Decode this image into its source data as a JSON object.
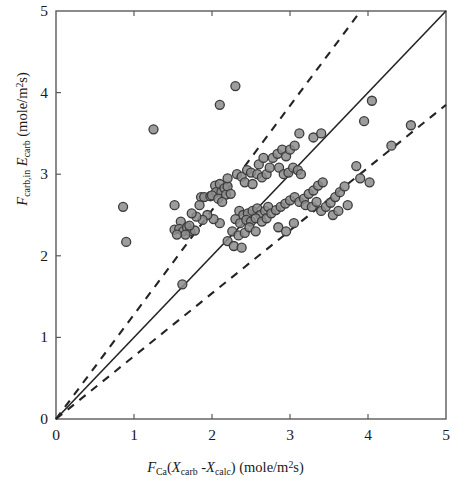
{
  "figure": {
    "background": "#ffffff",
    "frame_color": "#4a4a4a"
  },
  "axes": {
    "x_ticks": [
      "0",
      "1",
      "2",
      "3",
      "4",
      "5"
    ],
    "y_ticks": [
      "0",
      "1",
      "2",
      "3",
      "4",
      "5"
    ],
    "xlabel_parts": {
      "f": "F",
      "f_sub": "Ca",
      "open": "(",
      "x1": "X",
      "x1_sub": "carb",
      "minus": " -",
      "x2": "X",
      "x2_sub": "calc",
      "close": ")",
      "units_open": " (mole/m",
      "units_sup": "2",
      "units_close": "s)"
    },
    "ylabel_parts": {
      "f": "F",
      "f_sub": "carb,in",
      "e": "E",
      "e_sub": "carb",
      "units_open": " (mole/m",
      "units_sup": "2",
      "units_close": "s)"
    }
  },
  "chart_data": {
    "type": "scatter",
    "title": "",
    "xlabel": "F_Ca(X_carb - X_calc) (mole/m^2 s)",
    "ylabel": "F_carb,in E_carb (mole/m^2 s)",
    "xlim": [
      0,
      5
    ],
    "ylim": [
      0,
      5
    ],
    "xticks": [
      0,
      1,
      2,
      3,
      4,
      5
    ],
    "yticks": [
      0,
      1,
      2,
      3,
      4,
      5
    ],
    "grid": false,
    "legend": null,
    "marker": {
      "shape": "circle",
      "fill": "#8c8c8c",
      "edge": "#3c3c3c",
      "size_px": 9,
      "opacity": 0.85
    },
    "reference_lines": [
      {
        "name": "parity-line",
        "style": "solid",
        "color": "#242424",
        "slope": 1.0,
        "intercept": 0,
        "label": "1:1 line"
      },
      {
        "name": "upper-bound-line",
        "style": "dashed",
        "color": "#242424",
        "slope": 1.28,
        "intercept": 0,
        "label": "+28% bound"
      },
      {
        "name": "lower-bound-line",
        "style": "dashed",
        "color": "#242424",
        "slope": 0.77,
        "intercept": 0,
        "label": "-23% bound"
      }
    ],
    "points": [
      [
        0.86,
        2.6
      ],
      [
        0.9,
        2.17
      ],
      [
        1.25,
        3.55
      ],
      [
        1.52,
        2.62
      ],
      [
        1.6,
        2.42
      ],
      [
        1.62,
        1.65
      ],
      [
        1.52,
        2.32
      ],
      [
        1.58,
        2.33
      ],
      [
        1.63,
        2.3
      ],
      [
        1.68,
        2.35
      ],
      [
        1.72,
        2.3
      ],
      [
        1.66,
        2.26
      ],
      [
        1.78,
        2.31
      ],
      [
        1.55,
        2.26
      ],
      [
        1.71,
        2.37
      ],
      [
        1.86,
        2.72
      ],
      [
        1.9,
        2.72
      ],
      [
        1.98,
        2.73
      ],
      [
        1.84,
        2.62
      ],
      [
        2.04,
        2.86
      ],
      [
        2.1,
        2.88
      ],
      [
        2.05,
        2.78
      ],
      [
        2.12,
        2.78
      ],
      [
        2.16,
        2.83
      ],
      [
        2.0,
        2.74
      ],
      [
        2.08,
        2.7
      ],
      [
        2.18,
        2.75
      ],
      [
        2.2,
        2.85
      ],
      [
        2.24,
        2.76
      ],
      [
        2.13,
        2.66
      ],
      [
        2.1,
        3.85
      ],
      [
        2.3,
        4.08
      ],
      [
        2.2,
        2.95
      ],
      [
        2.32,
        3.0
      ],
      [
        2.38,
        2.97
      ],
      [
        2.45,
        3.05
      ],
      [
        2.5,
        3.02
      ],
      [
        2.42,
        2.9
      ],
      [
        2.52,
        2.88
      ],
      [
        2.6,
        3.12
      ],
      [
        2.66,
        3.2
      ],
      [
        2.58,
        3.0
      ],
      [
        2.64,
        2.96
      ],
      [
        2.7,
        3.0
      ],
      [
        2.74,
        3.08
      ],
      [
        2.78,
        3.2
      ],
      [
        2.84,
        3.25
      ],
      [
        2.9,
        3.3
      ],
      [
        2.95,
        3.22
      ],
      [
        3.0,
        3.3
      ],
      [
        3.06,
        3.35
      ],
      [
        2.86,
        3.08
      ],
      [
        2.92,
        3.0
      ],
      [
        2.98,
        3.02
      ],
      [
        3.04,
        3.08
      ],
      [
        3.1,
        3.05
      ],
      [
        3.14,
        3.0
      ],
      [
        2.35,
        2.55
      ],
      [
        2.4,
        2.5
      ],
      [
        2.46,
        2.52
      ],
      [
        2.52,
        2.55
      ],
      [
        2.58,
        2.58
      ],
      [
        2.62,
        2.5
      ],
      [
        2.68,
        2.55
      ],
      [
        2.72,
        2.6
      ],
      [
        2.3,
        2.45
      ],
      [
        2.36,
        2.4
      ],
      [
        2.44,
        2.44
      ],
      [
        2.5,
        2.42
      ],
      [
        2.56,
        2.46
      ],
      [
        2.64,
        2.42
      ],
      [
        2.7,
        2.46
      ],
      [
        2.76,
        2.52
      ],
      [
        2.82,
        2.56
      ],
      [
        2.88,
        2.6
      ],
      [
        2.94,
        2.64
      ],
      [
        3.0,
        2.68
      ],
      [
        3.06,
        2.72
      ],
      [
        3.12,
        2.66
      ],
      [
        3.18,
        2.7
      ],
      [
        3.24,
        2.76
      ],
      [
        3.3,
        2.8
      ],
      [
        3.36,
        2.86
      ],
      [
        3.42,
        2.9
      ],
      [
        3.2,
        2.62
      ],
      [
        3.28,
        2.6
      ],
      [
        3.34,
        2.66
      ],
      [
        3.4,
        2.55
      ],
      [
        3.46,
        2.6
      ],
      [
        3.52,
        2.65
      ],
      [
        3.58,
        2.72
      ],
      [
        3.64,
        2.78
      ],
      [
        3.7,
        2.85
      ],
      [
        3.55,
        2.5
      ],
      [
        3.62,
        2.55
      ],
      [
        3.74,
        2.62
      ],
      [
        2.26,
        2.3
      ],
      [
        2.34,
        2.25
      ],
      [
        2.42,
        2.28
      ],
      [
        2.2,
        2.18
      ],
      [
        2.28,
        2.12
      ],
      [
        2.38,
        2.1
      ],
      [
        2.48,
        2.35
      ],
      [
        2.56,
        2.3
      ],
      [
        2.1,
        2.4
      ],
      [
        2.02,
        2.45
      ],
      [
        1.94,
        2.5
      ],
      [
        1.88,
        2.44
      ],
      [
        1.8,
        2.48
      ],
      [
        1.74,
        2.52
      ],
      [
        3.95,
        3.65
      ],
      [
        4.05,
        3.9
      ],
      [
        4.55,
        3.6
      ],
      [
        4.3,
        3.35
      ],
      [
        3.85,
        3.1
      ],
      [
        3.9,
        2.95
      ],
      [
        4.02,
        2.9
      ],
      [
        3.3,
        3.45
      ],
      [
        3.4,
        3.5
      ],
      [
        3.12,
        3.5
      ],
      [
        2.85,
        2.35
      ],
      [
        2.95,
        2.3
      ],
      [
        3.05,
        2.4
      ]
    ]
  }
}
